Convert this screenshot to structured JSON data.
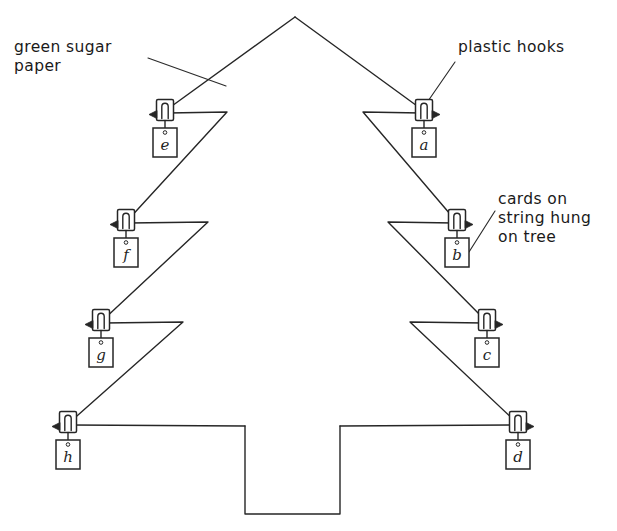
{
  "diagram": {
    "ink_color": "#262626",
    "paper_color": "#ffffff",
    "stroke_width": 1.4
  },
  "annotations": [
    {
      "id": "green-sugar-paper",
      "text": "green sugar\npaper",
      "x": 14,
      "y": 38,
      "leader": {
        "x1": 148,
        "y1": 58,
        "x2": 225,
        "y2": 85
      }
    },
    {
      "id": "plastic-hooks",
      "text": "plastic hooks",
      "x": 458,
      "y": 38,
      "leader": {
        "x1": 455,
        "y1": 62,
        "x2": 425,
        "y2": 103
      }
    },
    {
      "id": "cards-on-string",
      "text": "cards on\nstring hung\non tree",
      "x": 498,
      "y": 190,
      "leader": {
        "x1": 494,
        "y1": 212,
        "x2": 468,
        "y2": 252
      }
    }
  ],
  "tree": {
    "apex": {
      "x": 295,
      "y": 17
    },
    "trunk": {
      "left": 245,
      "right": 340,
      "top": 427,
      "bottom": 514
    },
    "left_outline": "295,17 65,424",
    "right_outline": "295,17 518,424",
    "tiers_left": [
      {
        "hook": {
          "x": 165,
          "y": 112
        },
        "notch_x": 227,
        "notch_y": 112
      },
      {
        "hook": {
          "x": 126,
          "y": 222
        },
        "notch_x": 208,
        "notch_y": 222
      },
      {
        "hook": {
          "x": 101,
          "y": 322
        },
        "notch_x": 183,
        "notch_y": 322
      },
      {
        "hook": {
          "x": 68,
          "y": 424
        },
        "notch_x": 245,
        "notch_y": 424
      }
    ],
    "tiers_right": [
      {
        "hook": {
          "x": 424,
          "y": 112
        },
        "notch_x": 363,
        "notch_y": 112
      },
      {
        "hook": {
          "x": 457,
          "y": 222
        },
        "notch_x": 388,
        "notch_y": 222
      },
      {
        "hook": {
          "x": 487,
          "y": 322
        },
        "notch_x": 410,
        "notch_y": 322
      },
      {
        "hook": {
          "x": 518,
          "y": 424
        },
        "notch_x": 340,
        "notch_y": 424
      }
    ]
  },
  "cards": [
    {
      "id": "card-a",
      "label": "a",
      "side": "right",
      "hook_x": 424,
      "hook_y": 112,
      "card_x": 424,
      "card_y": 130
    },
    {
      "id": "card-b",
      "label": "b",
      "side": "right",
      "hook_x": 457,
      "hook_y": 222,
      "card_x": 457,
      "card_y": 240
    },
    {
      "id": "card-c",
      "label": "c",
      "side": "right",
      "hook_x": 487,
      "hook_y": 322,
      "card_x": 487,
      "card_y": 340
    },
    {
      "id": "card-d",
      "label": "d",
      "side": "right",
      "hook_x": 518,
      "hook_y": 424,
      "card_x": 518,
      "card_y": 442
    },
    {
      "id": "card-e",
      "label": "e",
      "side": "left",
      "hook_x": 165,
      "hook_y": 112,
      "card_x": 165,
      "card_y": 130
    },
    {
      "id": "card-f",
      "label": "f",
      "side": "left",
      "hook_x": 126,
      "hook_y": 222,
      "card_x": 126,
      "card_y": 240
    },
    {
      "id": "card-g",
      "label": "g",
      "side": "left",
      "hook_x": 101,
      "hook_y": 322,
      "card_x": 101,
      "card_y": 340
    },
    {
      "id": "card-h",
      "label": "h",
      "side": "left",
      "hook_x": 68,
      "hook_y": 424,
      "card_x": 68,
      "card_y": 442
    }
  ],
  "card_letters": {
    "a": "a",
    "b": "b",
    "c": "c",
    "d": "d",
    "e": "e",
    "f": "f",
    "g": "g",
    "h": "h"
  }
}
